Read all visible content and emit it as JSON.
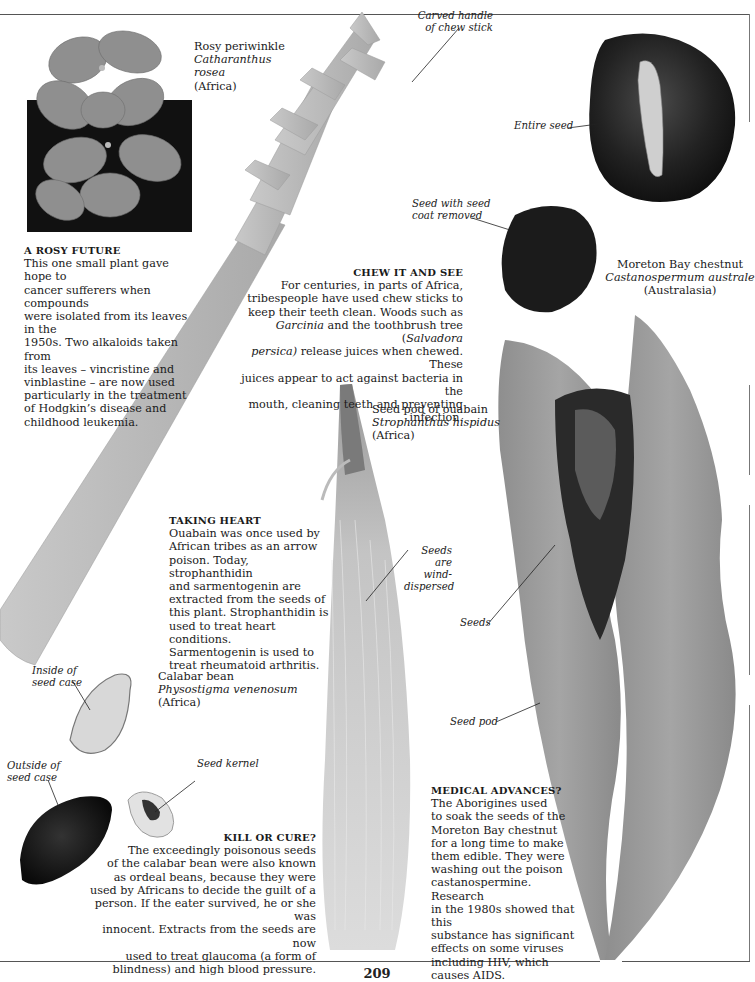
{
  "page": {
    "number": "209"
  },
  "specimens": {
    "periwinkle": {
      "common_name": "Rosy periwinkle",
      "latin_line1": "Catharanthus",
      "latin_line2": "rosea",
      "region": "(Africa)"
    },
    "chestnut": {
      "common_name": "Moreton Bay chestnut",
      "latin": "Castanospermum australe",
      "region": "(Australasia)"
    },
    "ouabain": {
      "common_name": "Seed pod of ouabain",
      "latin": "Strophanthus hispidus",
      "region": "(Africa)"
    },
    "calabar": {
      "common_name": "Calabar bean",
      "latin": "Physostigma venenosum",
      "region": "(Africa)"
    }
  },
  "labels": {
    "carved_handle_1": "Carved handle",
    "carved_handle_2": "of chew stick",
    "entire_seed": "Entire seed",
    "seed_coat_1": "Seed with seed",
    "seed_coat_2": "coat removed",
    "seeds_wind_1": "Seeds are",
    "seeds_wind_2": "wind-",
    "seeds_wind_3": "dispersed",
    "seeds": "Seeds",
    "seed_pod": "Seed pod",
    "inside_case_1": "Inside of",
    "inside_case_2": "seed case",
    "outside_case_1": "Outside of",
    "outside_case_2": "seed case",
    "seed_kernel": "Seed kernel"
  },
  "boxes": {
    "rosy_future": {
      "heading": "A ROSY FUTURE",
      "lines": [
        "This one small plant gave hope to",
        "cancer sufferers when compounds",
        "were isolated from its leaves in the",
        "1950s. Two alkaloids taken from",
        "its leaves – vincristine and",
        "vinblastine – are now used",
        "particularly in the treatment",
        "of Hodgkin’s disease and",
        "childhood leukemia."
      ]
    },
    "chew_it": {
      "heading": "CHEW IT AND SEE",
      "lines": [
        "For centuries, in parts of Africa,",
        "tribespeople have used chew sticks to",
        "keep their teeth clean. Woods such as",
        "and the toothbrush tree (",
        "release juices when chewed. These",
        "juices appear to act against bacteria in the",
        "mouth, cleaning teeth and preventing infection."
      ],
      "italic_garcinia": "Garcinia",
      "italic_salvadora": "Salvadora",
      "italic_persica": "persica)"
    },
    "taking_heart": {
      "heading": "TAKING HEART",
      "lines": [
        "Ouabain was once used by",
        "African tribes as an arrow",
        "poison. Today, strophanthidin",
        "and sarmentogenin are",
        "extracted from the seeds of",
        "this plant. Strophanthidin is",
        "used to treat heart conditions.",
        "Sarmentogenin is used to",
        "treat rheumatoid arthritis."
      ]
    },
    "kill_or_cure": {
      "heading": "KILL OR CURE?",
      "lines": [
        "The exceedingly poisonous seeds",
        "of the calabar bean were also known",
        "as ordeal beans, because they were",
        "used by Africans to decide the guilt of a",
        "person. If the eater survived, he or she was",
        "innocent. Extracts from the seeds are now",
        "used to treat glaucoma (a form of",
        "blindness) and high blood pressure."
      ]
    },
    "medical_advances": {
      "heading": "MEDICAL ADVANCES?",
      "lines": [
        "The Aborigines used",
        "to soak the seeds of the",
        "Moreton Bay chestnut",
        "for a long time to make",
        "them edible. They were",
        "washing out the poison",
        "castanospermine. Research",
        "in the 1980s showed that this",
        "substance has significant",
        "effects on some viruses",
        "including HIV, which",
        "causes AIDS."
      ]
    }
  }
}
